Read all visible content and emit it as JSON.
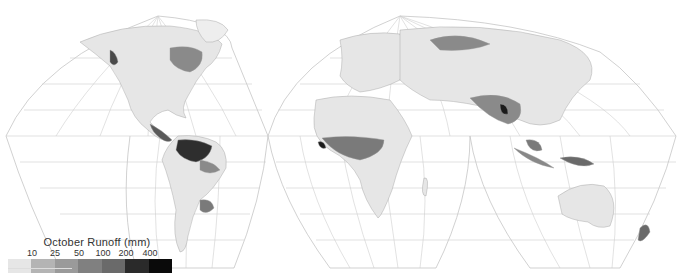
{
  "map": {
    "title": "October Runoff (mm)",
    "projection": "interrupted homolosine",
    "background_color": "#ffffff",
    "graticule_color": "#c8c8c8",
    "land_base_color": "#e8e8e8",
    "regions_high_runoff": [
      "Amazon basin",
      "Central America",
      "Pacific Northwest",
      "West Africa / Gulf of Guinea",
      "Southeast Asia / Myanmar",
      "Borneo",
      "New Guinea",
      "Eastern Canada",
      "Southern Chile",
      "New Zealand"
    ]
  },
  "legend": {
    "title": "October Runoff (mm)",
    "ticks": [
      "10",
      "25",
      "50",
      "100",
      "200",
      "400"
    ],
    "classes": [
      {
        "range": "<10",
        "color": "#e6e6e6"
      },
      {
        "range": "10-25",
        "color": "#b4b4b4"
      },
      {
        "range": "25-50",
        "color": "#9a9a9a"
      },
      {
        "range": "50-100",
        "color": "#808080"
      },
      {
        "range": "100-200",
        "color": "#6a6a6a"
      },
      {
        "range": "200-400",
        "color": "#2a2a2a"
      },
      {
        "range": ">400",
        "color": "#0a0a0a"
      }
    ]
  }
}
